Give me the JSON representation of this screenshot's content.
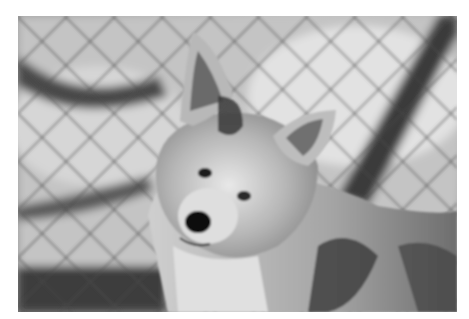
{
  "image": {
    "subject": "coyote",
    "description": "Black-and-white photograph of a coyote looking at the camera from behind a blurred chain-link fence",
    "style": "monochrome",
    "colors": {
      "background": "#ffffff",
      "light": "#e6e6e6",
      "mid": "#9a9a9a",
      "dark": "#2a2a2a"
    }
  }
}
